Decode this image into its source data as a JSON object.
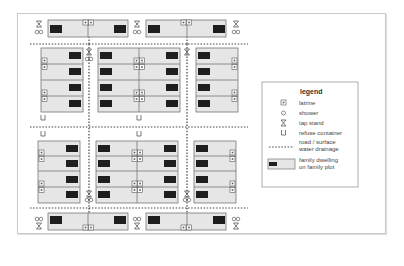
{
  "legend": {
    "title": "legend",
    "items": [
      {
        "icon": "latrine-icon",
        "label": "latrine"
      },
      {
        "icon": "shower-icon",
        "label": "shower"
      },
      {
        "icon": "tap-stand-icon",
        "label": "tap stand"
      },
      {
        "icon": "refuse-container-icon",
        "label": "refuse container"
      },
      {
        "icon": "drainage-line-icon",
        "label_line1": "road / surface",
        "label_line2": "water drainage"
      },
      {
        "icon": "family-dwelling-icon",
        "label_line1": "family dwelling",
        "label_line2": "on family plot"
      }
    ]
  },
  "colors": {
    "plot_fill": "#e6e6e6",
    "plot_border": "#777777",
    "dwelling": "#1e1e1e",
    "drainage": "#444444",
    "frame_border": "#c8c8c8"
  }
}
